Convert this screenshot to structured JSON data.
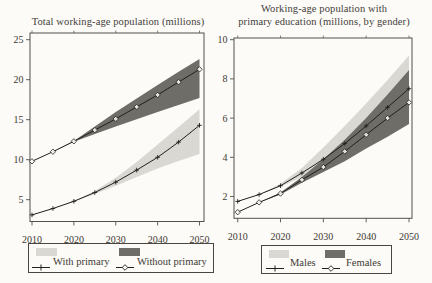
{
  "figure": {
    "background": "#fcfbf8",
    "text_color": "#45403a",
    "tick_text_color": "#3e3a33",
    "axis_color": "#55504a",
    "line_color": "#23201b",
    "light_band_color": "#d9d8d3",
    "dark_band_color": "#6f6d68"
  },
  "chart_data": [
    {
      "type": "line",
      "title": "Total working-age population (millions)",
      "title_lines": [
        "Total working-age population (millions)"
      ],
      "xlabel": "",
      "ylabel": "",
      "x": [
        2010,
        2015,
        2020,
        2025,
        2030,
        2035,
        2040,
        2045,
        2050
      ],
      "xticks": [
        2010,
        2020,
        2030,
        2040,
        2050
      ],
      "yticks": [
        5,
        10,
        15,
        20,
        25
      ],
      "ylim": [
        2.3,
        25.9
      ],
      "grid": false,
      "legend_position": "bottom",
      "series": [
        {
          "name": "With primary",
          "marker": "plus",
          "values": [
            3.1,
            3.9,
            4.8,
            5.9,
            7.2,
            8.7,
            10.3,
            12.2,
            14.3
          ],
          "band": {
            "color": "#d9d8d3",
            "upper": [
              3.1,
              3.9,
              4.85,
              6.1,
              7.75,
              9.7,
              11.9,
              14.1,
              16.3
            ],
            "lower": [
              3.1,
              3.9,
              4.75,
              5.7,
              6.75,
              7.85,
              8.9,
              9.85,
              10.7
            ]
          }
        },
        {
          "name": "Without primary",
          "marker": "diamond",
          "values": [
            9.8,
            11.0,
            12.3,
            13.7,
            15.1,
            16.6,
            18.1,
            19.7,
            21.3
          ],
          "band": {
            "color": "#6f6d68",
            "upper": [
              9.8,
              11.0,
              12.35,
              14.15,
              15.95,
              17.65,
              19.35,
              21.0,
              22.6
            ],
            "lower": [
              9.8,
              11.0,
              12.25,
              13.2,
              14.15,
              15.05,
              15.95,
              16.85,
              17.7
            ]
          }
        }
      ],
      "legend": {
        "entries": [
          {
            "label": "With primary",
            "marker": "plus",
            "swatch_color": "#d9d8d3"
          },
          {
            "label": "Without primary",
            "marker": "diamond",
            "swatch_color": "#6f6d68"
          }
        ]
      }
    },
    {
      "type": "line",
      "title": "Working-age population with primary education (millions, by gender)",
      "title_lines": [
        "Working-age population with",
        "primary education (millions, by gender)"
      ],
      "xlabel": "",
      "ylabel": "",
      "x": [
        2010,
        2015,
        2020,
        2025,
        2030,
        2035,
        2040,
        2045,
        2050
      ],
      "xticks": [
        2010,
        2020,
        2030,
        2040,
        2050
      ],
      "yticks": [
        2,
        4,
        6,
        8,
        10
      ],
      "ylim": [
        0.9,
        10.1
      ],
      "grid": false,
      "legend_position": "bottom",
      "series": [
        {
          "name": "Males",
          "marker": "plus",
          "values": [
            1.75,
            2.1,
            2.55,
            3.2,
            3.9,
            4.7,
            5.6,
            6.55,
            7.5
          ],
          "band": {
            "color": "#d9d8d3",
            "upper": [
              1.75,
              2.1,
              2.65,
              3.45,
              4.5,
              5.6,
              6.75,
              7.95,
              9.2
            ],
            "lower": [
              1.75,
              2.1,
              2.5,
              3.0,
              3.55,
              4.1,
              4.7,
              5.3,
              5.9
            ]
          }
        },
        {
          "name": "Females",
          "marker": "diamond",
          "values": [
            1.2,
            1.7,
            2.15,
            2.85,
            3.5,
            4.3,
            5.15,
            6.0,
            6.8
          ],
          "band": {
            "color": "#6f6d68",
            "upper": [
              1.2,
              1.7,
              2.2,
              3.0,
              3.9,
              4.9,
              6.0,
              7.2,
              8.45
            ],
            "lower": [
              1.2,
              1.7,
              2.1,
              2.7,
              3.25,
              3.8,
              4.45,
              5.05,
              5.7
            ]
          }
        }
      ],
      "legend": {
        "entries": [
          {
            "label": "Males",
            "marker": "plus",
            "swatch_color": "#d9d8d3"
          },
          {
            "label": "Females",
            "marker": "diamond",
            "swatch_color": "#6f6d68"
          }
        ]
      }
    }
  ]
}
